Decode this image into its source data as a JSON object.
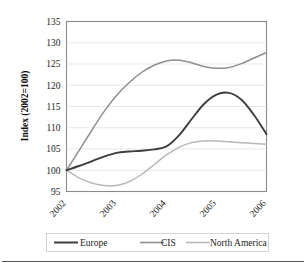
{
  "chart_data": {
    "type": "line",
    "title": "",
    "xlabel": "",
    "ylabel": "Index (2002=100)",
    "ylim": [
      95,
      135
    ],
    "xlim": [
      2002,
      2006
    ],
    "grid": true,
    "legend_position": "bottom",
    "yticks": [
      "95",
      "100",
      "105",
      "110",
      "115",
      "120",
      "125",
      "130",
      "135"
    ],
    "ytick_values": [
      95,
      100,
      105,
      110,
      115,
      120,
      125,
      130,
      135
    ],
    "xticks": [
      "2002",
      "2003",
      "2004",
      "2005",
      "2006"
    ],
    "xtick_values": [
      2002,
      2003,
      2004,
      2005,
      2006
    ],
    "x": [
      2002,
      2002.25,
      2002.5,
      2002.75,
      2003,
      2003.25,
      2003.5,
      2003.75,
      2004,
      2004.25,
      2004.5,
      2004.75,
      2005,
      2005.25,
      2005.5,
      2005.75,
      2006
    ],
    "series": [
      {
        "name": "Europe",
        "color": "#3d3d3d",
        "width": 1.9,
        "values": [
          100.0,
          101.0,
          102.1,
          103.2,
          104.1,
          104.4,
          104.6,
          104.9,
          105.6,
          108.2,
          112.0,
          115.6,
          117.8,
          118.2,
          116.6,
          113.0,
          108.5
        ]
      },
      {
        "name": "CIS",
        "color": "#8f8f8f",
        "width": 1.5,
        "values": [
          100.0,
          104.6,
          109.3,
          113.8,
          117.6,
          120.6,
          123.0,
          124.7,
          125.7,
          125.9,
          125.3,
          124.4,
          124.0,
          124.2,
          125.1,
          126.4,
          127.7
        ]
      },
      {
        "name": "North America",
        "color": "#b8b8b8",
        "width": 1.5,
        "values": [
          100.0,
          98.2,
          97.0,
          96.4,
          96.4,
          97.3,
          99.0,
          101.3,
          103.6,
          105.4,
          106.5,
          106.9,
          106.9,
          106.7,
          106.5,
          106.3,
          106.1
        ]
      }
    ],
    "legend": [
      {
        "label": "Europe",
        "color": "#3d3d3d",
        "width": 2.0
      },
      {
        "label": "CIS",
        "color": "#8f8f8f",
        "width": 1.6
      },
      {
        "label": "North America",
        "color": "#b8b8b8",
        "width": 1.6
      }
    ]
  }
}
